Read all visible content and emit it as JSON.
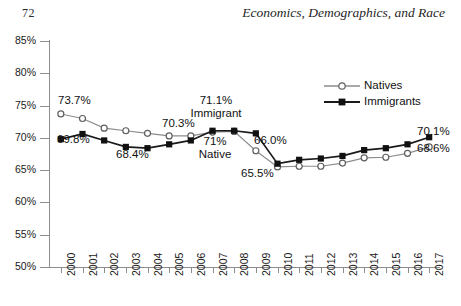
{
  "page": {
    "folio": "72",
    "running_title": "Economics, Demographics, and Race"
  },
  "chart_data": {
    "type": "line",
    "title": "",
    "subtitle": "",
    "xlabel": "",
    "ylabel": "",
    "grid": false,
    "legend_position": "top-right",
    "ylim": [
      50,
      85
    ],
    "ytick_step": 5,
    "ytick_labels": [
      "85%",
      "80%",
      "75%",
      "70%",
      "65%",
      "60%",
      "55%",
      "50%"
    ],
    "ytick_values": [
      85,
      80,
      75,
      70,
      65,
      60,
      55,
      50
    ],
    "categories": [
      "2000",
      "2001",
      "2002",
      "2003",
      "2004",
      "2005",
      "2006",
      "2007",
      "2008",
      "2009",
      "2010",
      "2011",
      "2012",
      "2013",
      "2014",
      "2015",
      "2016",
      "2017"
    ],
    "series": [
      {
        "name": "Natives",
        "marker": "open-circle",
        "color": "#8c8c8c",
        "values": [
          73.7,
          73.0,
          71.5,
          71.1,
          70.7,
          70.3,
          70.3,
          70.9,
          71.0,
          68.0,
          65.5,
          65.6,
          65.6,
          66.1,
          66.9,
          67.0,
          67.6,
          68.6
        ]
      },
      {
        "name": "Immigrants",
        "marker": "filled-square",
        "color": "#1a1a1a",
        "values": [
          69.8,
          70.6,
          69.6,
          68.6,
          68.4,
          69.0,
          69.6,
          71.1,
          71.1,
          70.7,
          66.0,
          66.6,
          66.8,
          67.2,
          68.1,
          68.4,
          69.0,
          70.1
        ]
      }
    ],
    "annotations": [
      {
        "text": "73.7%",
        "series": "Natives",
        "year": "2000"
      },
      {
        "text": "69.8%",
        "series": "Immigrants",
        "year": "2000"
      },
      {
        "text": "68.4%",
        "series": "Immigrants",
        "year": "2004"
      },
      {
        "text": "70.3%",
        "series": "Natives",
        "year": "2005"
      },
      {
        "text": "71.1%",
        "series": "Immigrants",
        "year": "2007"
      },
      {
        "text": "Immigrant",
        "series": "Immigrants",
        "year": "2007"
      },
      {
        "text": "71%",
        "series": "Natives",
        "year": "2008"
      },
      {
        "text": "Native",
        "series": "Natives",
        "year": "2008"
      },
      {
        "text": "66.0%",
        "series": "Immigrants",
        "year": "2010"
      },
      {
        "text": "65.5%",
        "series": "Natives",
        "year": "2010"
      },
      {
        "text": "70.1%",
        "series": "Immigrants",
        "year": "2017"
      },
      {
        "text": "68.6%",
        "series": "Natives",
        "year": "2017"
      }
    ],
    "labels": {
      "l_73_7": "73.7%",
      "l_69_8": "69.8%",
      "l_68_4": "68.4%",
      "l_70_3": "70.3%",
      "l_71_1": "71.1%",
      "l_immigrant": "Immigrant",
      "l_71": "71%",
      "l_native": "Native",
      "l_66_0": "66.0%",
      "l_65_5": "65.5%",
      "l_70_1": "70.1%",
      "l_68_6": "68.6%"
    },
    "legend": [
      {
        "label": "Natives"
      },
      {
        "label": "Immigrants"
      }
    ]
  }
}
